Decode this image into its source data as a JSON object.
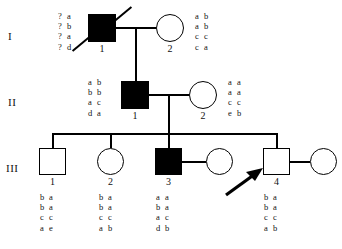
{
  "figure": {
    "type": "pedigree-chart",
    "ink_color": "#000000",
    "background_color": "#ffffff"
  },
  "generations": [
    {
      "label": "I"
    },
    {
      "label": "II"
    },
    {
      "label": "III"
    }
  ],
  "individuals": [
    {
      "key": "I-1",
      "generation": "I",
      "id": "1",
      "sex": "male",
      "shape": "square",
      "affected": true,
      "deceased": true,
      "proband": false,
      "haplotype_side": "left",
      "haplotype": [
        [
          "?",
          "a"
        ],
        [
          "?",
          "b"
        ],
        [
          "?",
          "a"
        ],
        [
          "?",
          "d"
        ]
      ]
    },
    {
      "key": "I-2",
      "generation": "I",
      "id": "2",
      "sex": "female",
      "shape": "circle",
      "affected": false,
      "deceased": false,
      "proband": false,
      "haplotype_side": "right",
      "haplotype": [
        [
          "a",
          "b"
        ],
        [
          "a",
          "b"
        ],
        [
          "c",
          "c"
        ],
        [
          "c",
          "a"
        ]
      ]
    },
    {
      "key": "II-1",
      "generation": "II",
      "id": "1",
      "sex": "male",
      "shape": "square",
      "affected": true,
      "deceased": false,
      "proband": false,
      "haplotype_side": "left",
      "haplotype": [
        [
          "a",
          "b"
        ],
        [
          "b",
          "b"
        ],
        [
          "a",
          "c"
        ],
        [
          "d",
          "a"
        ]
      ]
    },
    {
      "key": "II-2",
      "generation": "II",
      "id": "2",
      "sex": "female",
      "shape": "circle",
      "affected": false,
      "deceased": false,
      "proband": false,
      "haplotype_side": "right",
      "haplotype": [
        [
          "a",
          "a"
        ],
        [
          "a",
          "a"
        ],
        [
          "c",
          "c"
        ],
        [
          "e",
          "b"
        ]
      ]
    },
    {
      "key": "III-1",
      "generation": "III",
      "id": "1",
      "sex": "male",
      "shape": "square",
      "affected": false,
      "deceased": false,
      "proband": false,
      "haplotype_side": "below",
      "haplotype": [
        [
          "b",
          "a"
        ],
        [
          "b",
          "a"
        ],
        [
          "c",
          "c"
        ],
        [
          "a",
          "e"
        ]
      ]
    },
    {
      "key": "III-2",
      "generation": "III",
      "id": "2",
      "sex": "female",
      "shape": "circle",
      "affected": false,
      "deceased": false,
      "proband": false,
      "haplotype_side": "below",
      "haplotype": [
        [
          "b",
          "a"
        ],
        [
          "b",
          "a"
        ],
        [
          "c",
          "c"
        ],
        [
          "a",
          "b"
        ]
      ]
    },
    {
      "key": "III-3",
      "generation": "III",
      "id": "3",
      "sex": "male",
      "shape": "square",
      "affected": true,
      "deceased": false,
      "proband": false,
      "haplotype_side": "below",
      "haplotype": [
        [
          "a",
          "a"
        ],
        [
          "b",
          "a"
        ],
        [
          "a",
          "c"
        ],
        [
          "d",
          "b"
        ]
      ]
    },
    {
      "key": "III-3-spouse",
      "generation": "III",
      "id": "",
      "sex": "female",
      "shape": "circle",
      "affected": false,
      "deceased": false,
      "proband": false,
      "haplotype_side": "none",
      "haplotype": []
    },
    {
      "key": "III-4",
      "generation": "III",
      "id": "4",
      "sex": "male",
      "shape": "square",
      "affected": false,
      "deceased": false,
      "proband": true,
      "haplotype_side": "below",
      "haplotype": [
        [
          "b",
          "a"
        ],
        [
          "b",
          "a"
        ],
        [
          "c",
          "c"
        ],
        [
          "a",
          "b"
        ]
      ]
    },
    {
      "key": "III-4-spouse",
      "generation": "III",
      "id": "",
      "sex": "female",
      "shape": "circle",
      "affected": false,
      "deceased": false,
      "proband": false,
      "haplotype_side": "none",
      "haplotype": []
    }
  ],
  "markers": {
    "proband_arrow_target": "III-4",
    "proband_arrow_direction": "up-right"
  }
}
